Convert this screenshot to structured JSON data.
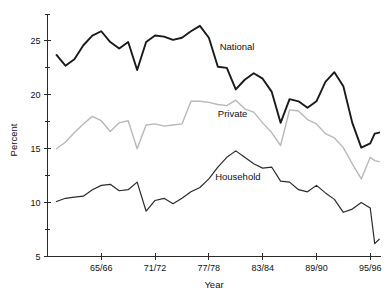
{
  "chart_data": {
    "type": "line",
    "title": "",
    "subtitle": "",
    "xlabel": "Year",
    "ylabel": "Percent",
    "grid": false,
    "legend_position": "inline-annotation",
    "xlim": [
      1960,
      1996
    ],
    "ylim": [
      5,
      27.5
    ],
    "x_tick_labels": [
      "65/66",
      "71/72",
      "77/78",
      "83/84",
      "89/90",
      "95/96"
    ],
    "x_tick_values": [
      1966,
      1972,
      1978,
      1984,
      1990,
      1996
    ],
    "y_tick_labels": [
      "5",
      "10",
      "15",
      "20",
      "25"
    ],
    "y_tick_values": [
      5,
      10,
      15,
      20,
      25
    ],
    "x": [
      1961,
      1962,
      1963,
      1964,
      1965,
      1966,
      1967,
      1968,
      1969,
      1970,
      1971,
      1972,
      1973,
      1974,
      1975,
      1976,
      1977,
      1978,
      1979,
      1980,
      1981,
      1982,
      1983,
      1984,
      1985,
      1986,
      1987,
      1988,
      1989,
      1990,
      1991,
      1992,
      1993,
      1994,
      1995,
      1996
    ],
    "series": [
      {
        "name": "National",
        "color": "#1a1a1a",
        "stroke_width": 1.9,
        "label_x": 1979.2,
        "label_y": 24.2,
        "values": [
          23.7,
          22.7,
          23.3,
          24.6,
          25.5,
          25.9,
          24.9,
          24.3,
          24.9,
          22.3,
          24.9,
          25.5,
          25.4,
          25.1,
          25.3,
          25.9,
          26.4,
          25.3,
          22.6,
          22.5,
          20.5,
          21.4,
          22.0,
          21.5,
          20.3,
          17.4,
          19.6,
          19.4,
          18.8,
          19.4,
          21.2,
          22.1,
          20.8,
          17.4,
          15.1,
          15.5
        ]
      },
      {
        "name": "Private",
        "color": "#b8b8b8",
        "stroke_width": 1.4,
        "label_x": 1979.0,
        "label_y": 17.9,
        "values": [
          15.0,
          15.6,
          16.5,
          17.3,
          18.0,
          17.6,
          16.6,
          17.4,
          17.6,
          15.0,
          17.2,
          17.3,
          17.1,
          17.2,
          17.3,
          19.4,
          19.4,
          19.3,
          19.1,
          19.0,
          19.5,
          18.7,
          18.4,
          17.4,
          16.5,
          15.3,
          18.6,
          18.5,
          17.7,
          17.3,
          16.4,
          16.0,
          15.1,
          13.6,
          12.2,
          14.2
        ]
      },
      {
        "name": "Household",
        "color": "#2b2b2b",
        "stroke_width": 1.2,
        "label_x": 1978.7,
        "label_y": 12.1,
        "values": [
          10.1,
          10.4,
          10.5,
          10.6,
          11.2,
          11.6,
          11.7,
          11.1,
          11.2,
          11.9,
          9.2,
          10.2,
          10.4,
          9.9,
          10.4,
          11.0,
          11.4,
          12.2,
          13.3,
          14.2,
          14.8,
          14.2,
          13.6,
          13.2,
          13.3,
          12.0,
          11.9,
          11.2,
          11.0,
          11.6,
          10.9,
          10.3,
          9.1,
          9.4,
          10.0,
          9.5
        ]
      }
    ],
    "series_tail": [
      {
        "name": "National",
        "x": [
          1996.5,
          1997
        ],
        "values": [
          16.4,
          16.5
        ]
      },
      {
        "name": "Private",
        "x": [
          1996.5,
          1997
        ],
        "values": [
          13.9,
          13.8
        ]
      },
      {
        "name": "Household",
        "x": [
          1996.5,
          1997
        ],
        "values": [
          6.2,
          6.6
        ]
      }
    ]
  },
  "axes": {
    "y_title": "Percent",
    "x_title": "Year",
    "y_ticks": [
      "25",
      "20",
      "15",
      "10",
      "5"
    ],
    "x_ticks": [
      "65/66",
      "71/72",
      "77/78",
      "83/84",
      "89/90",
      "95/96"
    ]
  },
  "annotations": {
    "national": "National",
    "private": "Private",
    "household": "Household"
  }
}
